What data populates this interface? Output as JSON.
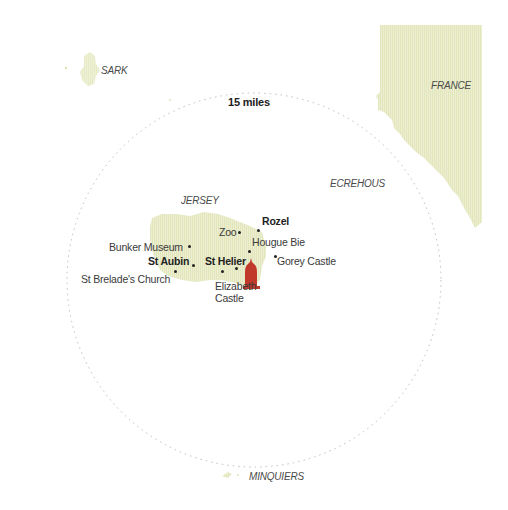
{
  "map": {
    "radius_label": "15 miles",
    "colors": {
      "land": "#e9ecca",
      "land_texture": "#dfe3b6",
      "circle": "#b8b8b8",
      "marker": "#c0392b",
      "text": "#3a3a3a"
    },
    "regions": [
      {
        "id": "sark",
        "label": "SARK"
      },
      {
        "id": "france",
        "label": "FRANCE"
      },
      {
        "id": "ecrehous",
        "label": "ECREHOUS"
      },
      {
        "id": "jersey",
        "label": "JERSEY"
      },
      {
        "id": "minquiers",
        "label": "MINQUIERS"
      }
    ],
    "places": [
      {
        "id": "rozel",
        "label": "Rozel",
        "emphasis": "bold"
      },
      {
        "id": "zoo",
        "label": "Zoo"
      },
      {
        "id": "hougue-bie",
        "label": "Hougue Bie"
      },
      {
        "id": "bunker-museum",
        "label": "Bunker Museum"
      },
      {
        "id": "gorey-castle",
        "label": "Gorey Castle"
      },
      {
        "id": "st-aubin",
        "label": "St Aubin",
        "emphasis": "bold"
      },
      {
        "id": "st-helier",
        "label": "St Helier",
        "emphasis": "bold"
      },
      {
        "id": "st-brelades-church",
        "label": "St Brelade's Church"
      },
      {
        "id": "elizabeth-castle",
        "label": "Elizabeth",
        "label2": "Castle"
      }
    ],
    "marker": {
      "icon": "location-tower-icon",
      "location": "St Helier"
    }
  }
}
